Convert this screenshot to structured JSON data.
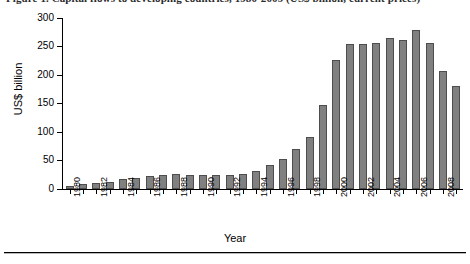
{
  "figure": {
    "caption_partial": "Figure 1. Capital flows to developing countries, 1980-2009 (US$ billion, current prices)",
    "bottom_rule": "horizontal-rule"
  },
  "chart_data": {
    "type": "bar",
    "title": "",
    "xlabel": "Year",
    "ylabel": "US$ billion",
    "ylim": [
      0,
      300
    ],
    "ytick_values": [
      0,
      50,
      100,
      150,
      200,
      250,
      300
    ],
    "ytick_labels": [
      "0",
      "50",
      "100",
      "150",
      "200",
      "250",
      "300"
    ],
    "grid": false,
    "legend": "none",
    "bar_color": "#808080",
    "bar_edge_color": "#4d4d4d",
    "axis_color": "#000000",
    "categories": [
      "1980",
      "1981",
      "1982",
      "1983",
      "1984",
      "1985",
      "1986",
      "1987",
      "1988",
      "1989",
      "1990",
      "1991",
      "1992",
      "1993",
      "1994",
      "1995",
      "1996",
      "1997",
      "1998",
      "1999",
      "2000",
      "2001",
      "2002",
      "2003",
      "2004",
      "2005",
      "2006",
      "2007",
      "2008",
      "2009"
    ],
    "xtick_labels_shown": [
      "1980",
      "1982",
      "1984",
      "1986",
      "1988",
      "1990",
      "1992",
      "1994",
      "1996",
      "1998",
      "2000",
      "2002",
      "2004",
      "2006",
      "2008"
    ],
    "values": [
      6,
      8,
      11,
      13,
      18,
      20,
      22,
      25,
      26,
      25,
      25,
      24,
      25,
      27,
      31,
      43,
      53,
      71,
      92,
      147,
      226,
      254,
      254,
      257,
      265,
      262,
      279,
      257,
      207,
      180
    ]
  }
}
